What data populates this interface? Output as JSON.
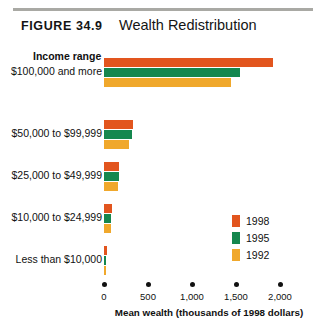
{
  "header": {
    "figure_number": "FIGURE 34.9",
    "title": "Wealth Redistribution"
  },
  "plot": {
    "category_axis_label": "Income range",
    "axis_title": "Mean wealth (thousands of 1998 dollars)"
  },
  "colors": {
    "series_1998": "#E2551E",
    "series_1995": "#15874E",
    "series_1992": "#F0A82C",
    "rule": "#a9a9a4",
    "text": "#111111"
  },
  "legend": {
    "entries": [
      {
        "label": "1998",
        "color": "#E2551E"
      },
      {
        "label": "1995",
        "color": "#15874E"
      },
      {
        "label": "1992",
        "color": "#F0A82C"
      }
    ]
  },
  "chart_data": {
    "type": "bar",
    "orientation": "horizontal",
    "title": "Wealth Redistribution",
    "xlabel": "Mean wealth (thousands of 1998 dollars)",
    "ylabel": "Income range",
    "xlim": [
      0,
      2000
    ],
    "xticks": [
      0,
      500,
      1000,
      1500,
      2000
    ],
    "xtick_labels": [
      "0",
      "500",
      "1,000",
      "1,500",
      "2,000"
    ],
    "grid": false,
    "legend_position": "right-middle",
    "categories": [
      "$100,000 and more",
      "$50,000 to $99,999",
      "$25,000 to $49,999",
      "$10,000 to $24,999",
      "Less than $10,000"
    ],
    "series": [
      {
        "name": "1998",
        "color": "#E2551E",
        "values": [
          1920,
          330,
          170,
          90,
          30
        ]
      },
      {
        "name": "1995",
        "color": "#15874E",
        "values": [
          1545,
          320,
          165,
          85,
          25
        ]
      },
      {
        "name": "1992",
        "color": "#F0A82C",
        "values": [
          1440,
          285,
          160,
          80,
          25
        ]
      }
    ]
  }
}
